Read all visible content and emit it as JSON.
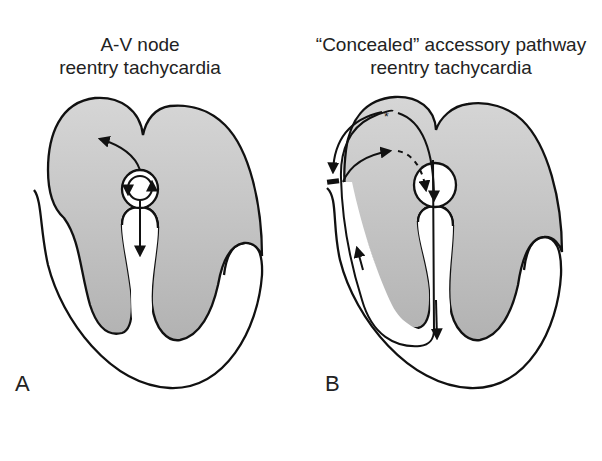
{
  "figure": {
    "panels": [
      {
        "id": "A",
        "label": "A",
        "title_lines": [
          "A-V node",
          "reentry tachycardia"
        ],
        "elements": [
          "atria",
          "ventricles",
          "av-node-circuit",
          "septum",
          "retrograde-atrial-arrow",
          "antegrade-ventricular-arrow"
        ]
      },
      {
        "id": "B",
        "label": "B",
        "title_lines": [
          "“Concealed” accessory pathway",
          "reentry tachycardia"
        ],
        "elements": [
          "atria",
          "ventricles",
          "av-node",
          "accessory-pathway-block",
          "reentry-loop",
          "asterisk-marker",
          "dashed-conduction-arrow"
        ],
        "marker": "*"
      }
    ],
    "colors": {
      "shading": "#c8c8c8",
      "shading_dark": "#b4b4b4",
      "outline": "#111111",
      "background": "#ffffff"
    }
  }
}
